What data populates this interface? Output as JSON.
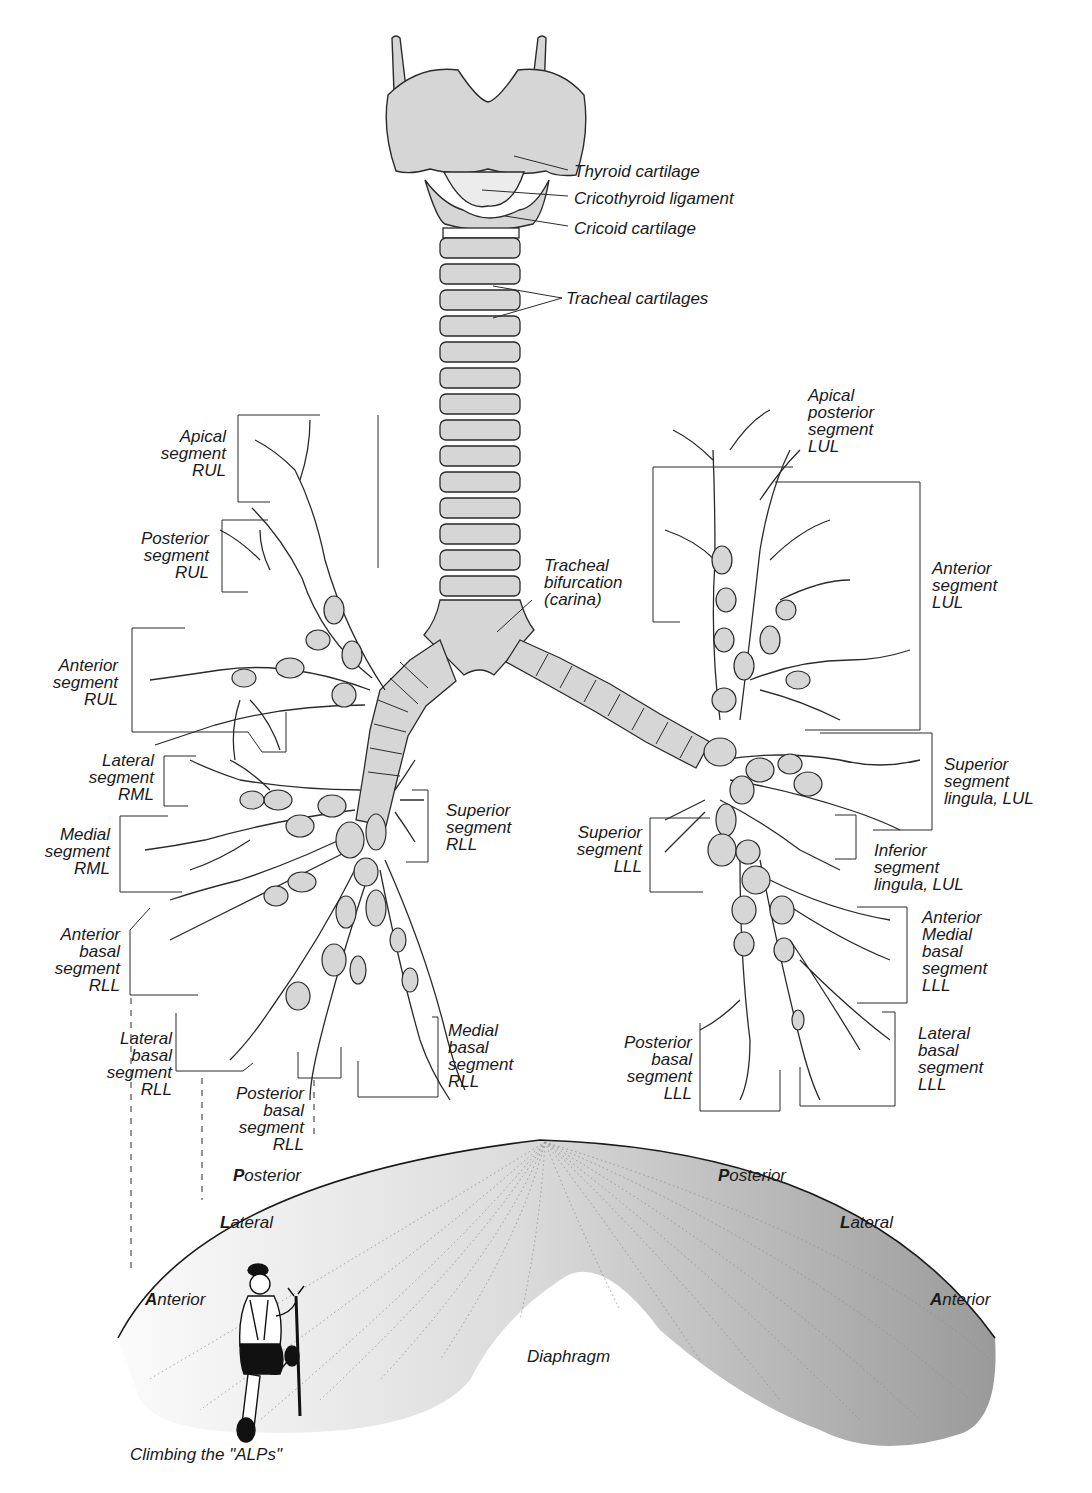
{
  "figure": {
    "larynx_labels": {
      "thyroid": "Thyroid cartilage",
      "cricothyroid": "Cricothyroid ligament",
      "cricoid": "Cricoid cartilage",
      "tracheal": "Tracheal cartilages",
      "carina": [
        "Tracheal",
        "bifurcation",
        "(carina)"
      ]
    },
    "right_lung_labels": {
      "apical_rul": [
        "Apical",
        "segment",
        "RUL"
      ],
      "posterior_rul": [
        "Posterior",
        "segment",
        "RUL"
      ],
      "anterior_rul": [
        "Anterior",
        "segment",
        "RUL"
      ],
      "lateral_rml": [
        "Lateral",
        "segment",
        "RML"
      ],
      "medial_rml": [
        "Medial",
        "segment",
        "RML"
      ],
      "superior_rll": [
        "Superior",
        "segment",
        "RLL"
      ],
      "anterior_basal_rll": [
        "Anterior",
        "basal",
        "segment",
        "RLL"
      ],
      "lateral_basal_rll": [
        "Lateral",
        "basal",
        "segment",
        "RLL"
      ],
      "posterior_basal_rll": [
        "Posterior",
        "basal",
        "segment",
        "RLL"
      ],
      "medial_basal_rll": [
        "Medial",
        "basal",
        "segment",
        "RLL"
      ]
    },
    "left_lung_labels": {
      "apical_posterior_lul": [
        "Apical",
        "posterior",
        "segment",
        "LUL"
      ],
      "anterior_lul": [
        "Anterior",
        "segment",
        "LUL"
      ],
      "superior_lingula": [
        "Superior",
        "segment",
        "lingula, LUL"
      ],
      "inferior_lingula": [
        "Inferior",
        "segment",
        "lingula, LUL"
      ],
      "superior_lll": [
        "Superior",
        "segment",
        "LLL"
      ],
      "anterior_medial_basal_lll": [
        "Anterior",
        "Medial",
        "basal",
        "segment",
        "LLL"
      ],
      "posterior_basal_lll": [
        "Posterior",
        "basal",
        "segment",
        "LLL"
      ],
      "lateral_basal_lll": [
        "Lateral",
        "basal",
        "segment",
        "LLL"
      ]
    },
    "diaphragm": {
      "label": "Diaphragm",
      "left_alps": [
        {
          "initial": "P",
          "rest": "osterior"
        },
        {
          "initial": "L",
          "rest": "ateral"
        },
        {
          "initial": "A",
          "rest": "nterior"
        }
      ],
      "right_alps": [
        {
          "initial": "P",
          "rest": "osterior"
        },
        {
          "initial": "L",
          "rest": "ateral"
        },
        {
          "initial": "A",
          "rest": "nterior"
        }
      ],
      "caption": "Climbing the \"ALPs\""
    },
    "colors": {
      "cartilage_fill": "#d6d6d6",
      "outline": "#2a2a2a",
      "diaphragm_light": "#f4f4f4",
      "diaphragm_dark": "#9c9c9c"
    }
  }
}
